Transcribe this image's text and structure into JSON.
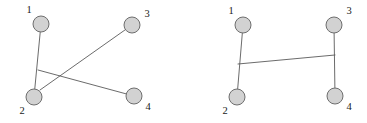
{
  "figure": {
    "background_color": "#ffffff",
    "node_fill_color": "#d2d2d2",
    "node_stroke_color": "#6e6e6e",
    "edge_color": "#5a5a5a",
    "label_color": "#1a1a1a",
    "node_radius": 8
  },
  "graphs": [
    {
      "id": "left-graph",
      "name": "crossing-edges-graph",
      "nodes": [
        {
          "id": "1",
          "label": "1",
          "cx": 41,
          "cy": 24,
          "label_x": 29,
          "label_y": 11
        },
        {
          "id": "2",
          "label": "2",
          "cx": 34,
          "cy": 97,
          "label_x": 22,
          "label_y": 112
        },
        {
          "id": "3",
          "label": "3",
          "cx": 132,
          "cy": 25,
          "label_x": 147,
          "label_y": 15
        },
        {
          "id": "4",
          "label": "4",
          "cx": 134,
          "cy": 96,
          "label_x": 148,
          "label_y": 108
        }
      ],
      "edges": [
        {
          "from": "1",
          "to": "2",
          "x1": 41,
          "y1": 24,
          "x2": 34,
          "y2": 97
        },
        {
          "from": "2",
          "to": "3",
          "x1": 40,
          "y1": 90,
          "x2": 132,
          "y2": 25
        },
        {
          "from": "2",
          "to": "4",
          "x1": 38,
          "y1": 70,
          "x2": 134,
          "y2": 96
        }
      ]
    },
    {
      "id": "right-graph",
      "name": "non-crossing-edges-graph",
      "nodes": [
        {
          "id": "1",
          "label": "1",
          "cx": 243,
          "cy": 25,
          "label_x": 231,
          "label_y": 12
        },
        {
          "id": "2",
          "label": "2",
          "cx": 237,
          "cy": 97,
          "label_x": 225,
          "label_y": 112
        },
        {
          "id": "3",
          "label": "3",
          "cx": 334,
          "cy": 25,
          "label_x": 349,
          "label_y": 12
        },
        {
          "id": "4",
          "label": "4",
          "cx": 335,
          "cy": 96,
          "label_x": 349,
          "label_y": 108
        }
      ],
      "edges": [
        {
          "from": "1",
          "to": "2",
          "x1": 243,
          "y1": 25,
          "x2": 237,
          "y2": 97
        },
        {
          "from": "2",
          "to": "3",
          "x1": 238,
          "y1": 64,
          "x2": 335,
          "y2": 55
        },
        {
          "from": "3",
          "to": "4",
          "x1": 334,
          "y1": 25,
          "x2": 335,
          "y2": 96
        }
      ]
    }
  ]
}
